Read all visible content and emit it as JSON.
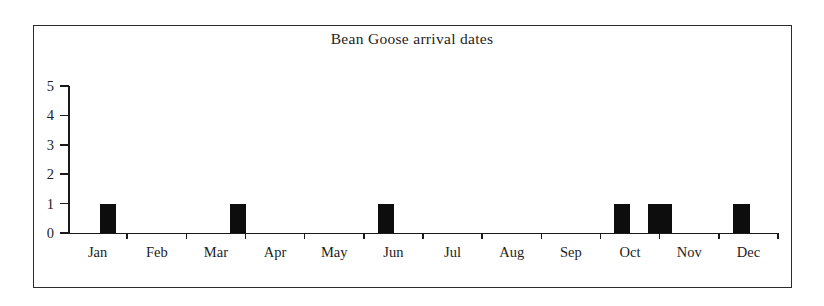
{
  "chart_data": {
    "type": "bar",
    "title": "Bean Goose arrival dates",
    "xlabel": "",
    "ylabel": "",
    "categories": [
      "Jan",
      "Feb",
      "Mar",
      "Apr",
      "May",
      "Jun",
      "Jul",
      "Aug",
      "Sep",
      "Oct",
      "Nov",
      "Dec"
    ],
    "values": [
      1,
      0,
      1,
      0,
      0,
      1,
      0,
      0,
      1,
      1,
      0,
      1
    ],
    "ylim": [
      0,
      5
    ],
    "y_ticks": [
      "0",
      "1",
      "2",
      "3",
      "4",
      "5"
    ],
    "grid": false,
    "legend": "none",
    "bar_color": "#0d0d0d",
    "bars": [
      {
        "label": "Jan",
        "value": 1,
        "x_start": 100,
        "x_end": 116
      },
      {
        "label": "Mar",
        "value": 1,
        "x_start": 230,
        "x_end": 246
      },
      {
        "label": "Jun",
        "value": 1,
        "x_start": 378,
        "x_end": 394
      },
      {
        "label": "Sep-Oct",
        "value": 1,
        "x_start": 614,
        "x_end": 630
      },
      {
        "label": "Oct-Nov",
        "value": 1,
        "x_start": 648,
        "x_end": 672
      },
      {
        "label": "Dec",
        "value": 1,
        "x_start": 733,
        "x_end": 750
      }
    ]
  },
  "chart": {
    "title": "Bean Goose arrival dates",
    "y_axis": {
      "ticks": [
        {
          "label": "5",
          "value": 5
        },
        {
          "label": "4",
          "value": 4
        },
        {
          "label": "3",
          "value": 3
        },
        {
          "label": "2",
          "value": 2
        },
        {
          "label": "1",
          "value": 1
        },
        {
          "label": "0",
          "value": 0
        }
      ]
    },
    "x_axis": {
      "ticks": [
        {
          "label": "Jan"
        },
        {
          "label": "Feb"
        },
        {
          "label": "Mar"
        },
        {
          "label": "Apr"
        },
        {
          "label": "May"
        },
        {
          "label": "Jun"
        },
        {
          "label": "Jul"
        },
        {
          "label": "Aug"
        },
        {
          "label": "Sep"
        },
        {
          "label": "Oct"
        },
        {
          "label": "Nov"
        },
        {
          "label": "Dec"
        }
      ]
    }
  },
  "colors": {
    "bar": "#0d0d0d",
    "axis": "#1a1a1a",
    "frame": "#2b2b2b",
    "text": "#1d1d1d",
    "background": "#ffffff"
  }
}
